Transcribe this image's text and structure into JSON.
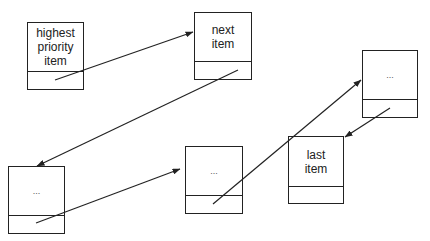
{
  "diagram": {
    "type": "linked-list priority queue",
    "nodes": [
      {
        "id": "n1",
        "label": "highest priority item",
        "x": 27,
        "y": 22,
        "w": 57,
        "h": 68,
        "divider": 48
      },
      {
        "id": "n2",
        "label": "next item",
        "x": 194,
        "y": 12,
        "w": 58,
        "h": 68,
        "divider": 48
      },
      {
        "id": "n3",
        "label": "...",
        "x": 8,
        "y": 166,
        "w": 57,
        "h": 68,
        "divider": 48
      },
      {
        "id": "n4",
        "label": "...",
        "x": 185,
        "y": 146,
        "w": 58,
        "h": 68,
        "divider": 48
      },
      {
        "id": "n5",
        "label": "...",
        "x": 362,
        "y": 50,
        "w": 56,
        "h": 68,
        "divider": 48
      },
      {
        "id": "n6",
        "label": "last item",
        "x": 288,
        "y": 136,
        "w": 56,
        "h": 68,
        "divider": 49
      }
    ],
    "edges": [
      {
        "from": "n1",
        "to": "n2",
        "x1": 55,
        "y1": 80,
        "x2": 193,
        "y2": 32
      },
      {
        "from": "n2",
        "to": "n3",
        "x1": 238,
        "y1": 70,
        "x2": 37,
        "y2": 166
      },
      {
        "from": "n3",
        "to": "n4",
        "x1": 36,
        "y1": 223,
        "x2": 180,
        "y2": 169
      },
      {
        "from": "n4",
        "to": "n5",
        "x1": 213,
        "y1": 204,
        "x2": 361,
        "y2": 80
      },
      {
        "from": "n5",
        "to": "n6",
        "x1": 390,
        "y1": 108,
        "x2": 345,
        "y2": 137
      }
    ],
    "line_color": "#222222"
  },
  "labels": {
    "n1": "highest\npriority\nitem",
    "n2": "next\nitem",
    "n3": "...",
    "n4": "...",
    "n5": "...",
    "n6": "last\nitem"
  }
}
